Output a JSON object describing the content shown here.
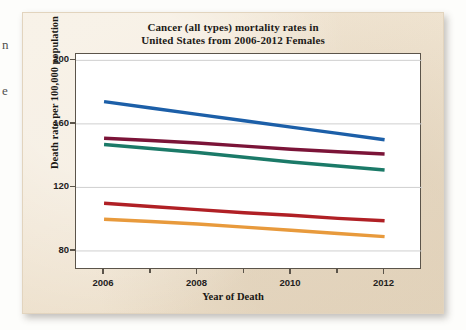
{
  "page": {
    "edge_fragments": [
      "n",
      "e"
    ]
  },
  "chart_data": {
    "type": "line",
    "title": "Cancer (all types) mortality rates in United States from 2006-2012 Females",
    "title_line1": "Cancer (all types) mortality rates in",
    "title_line2": "United States from 2006-2012 Females",
    "xlabel": "Year of Death",
    "ylabel": "Death rate per 100,000 population",
    "x": [
      2006,
      2007,
      2008,
      2009,
      2010,
      2011,
      2012
    ],
    "xlim": [
      2005.4,
      2012.8
    ],
    "ylim": [
      68,
      204
    ],
    "xticks": [
      2006,
      2008,
      2010,
      2012
    ],
    "xtick_labels": [
      "2006",
      "2008",
      "2010",
      "2012"
    ],
    "yticks": [
      80,
      120,
      160,
      200
    ],
    "ytick_labels": [
      "80",
      "120",
      "160",
      "200"
    ],
    "grid": "horizontal",
    "legend": "none",
    "series": [
      {
        "name": "series-1-blue",
        "color": "#1C5FA8",
        "values": [
          174,
          170,
          166,
          162,
          158,
          154,
          150
        ]
      },
      {
        "name": "series-2-maroon",
        "color": "#7B1438",
        "values": [
          151,
          149.5,
          148,
          146,
          144,
          142.5,
          141
        ]
      },
      {
        "name": "series-3-teal",
        "color": "#1B7A68",
        "values": [
          147,
          144.5,
          142,
          139,
          136,
          133.5,
          131
        ]
      },
      {
        "name": "series-4-red",
        "color": "#B02025",
        "values": [
          110,
          108,
          106,
          104,
          102.5,
          100.5,
          99
        ]
      },
      {
        "name": "series-5-orange",
        "color": "#E89A3C",
        "values": [
          100,
          98.5,
          97,
          95,
          93,
          91,
          89
        ]
      }
    ]
  }
}
